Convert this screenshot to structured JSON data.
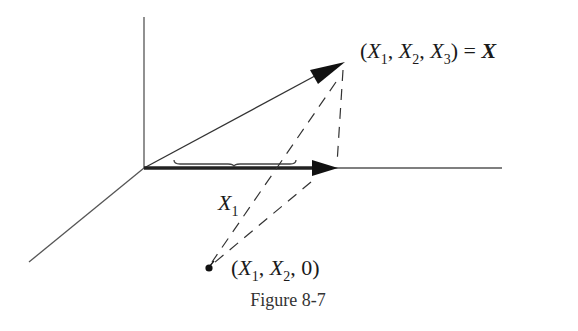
{
  "figure": {
    "caption": "Figure 8-7",
    "colors": {
      "axis": "#555555",
      "vector": "#333333",
      "dashed": "#333333",
      "text": "#1a1a1a"
    }
  },
  "labels": {
    "vector_label": {
      "open": "(",
      "x": "X",
      "sub1": "1",
      "comma1": ", ",
      "sub2": "2",
      "comma2": ", ",
      "sub3": "3",
      "close": ")",
      "equals": " = ",
      "bold_x": "X"
    },
    "projection_label": {
      "open": "(",
      "x": "X",
      "sub1": "1",
      "comma1": ", ",
      "sub2": "2",
      "comma2": ", ",
      "zero": "0",
      "close": ")"
    },
    "component_label": {
      "x": "X",
      "sub": "1"
    }
  }
}
